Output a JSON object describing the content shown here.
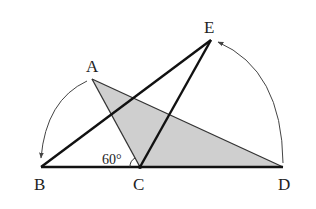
{
  "diagram": {
    "type": "geometry",
    "points": {
      "A": {
        "label": "A",
        "x": 92,
        "y": 79
      },
      "B": {
        "label": "B",
        "x": 41,
        "y": 167
      },
      "C": {
        "label": "C",
        "x": 140,
        "y": 167
      },
      "D": {
        "label": "D",
        "x": 283,
        "y": 167
      },
      "E": {
        "label": "E",
        "x": 211,
        "y": 40
      }
    },
    "angle_label": "60°",
    "shaded_triangle": [
      "A",
      "C",
      "D"
    ],
    "bold_segments": [
      [
        "B",
        "D"
      ],
      [
        "B",
        "E"
      ],
      [
        "C",
        "E"
      ]
    ],
    "thin_segments": [
      [
        "A",
        "C"
      ],
      [
        "A",
        "D"
      ]
    ],
    "rotation_arcs": [
      {
        "from": "A",
        "to": "B",
        "center": "C"
      },
      {
        "from": "D",
        "to": "E",
        "center": "C"
      }
    ],
    "colors": {
      "shade": "#cfcfcf",
      "line": "#111111",
      "arc": "#444444"
    }
  }
}
